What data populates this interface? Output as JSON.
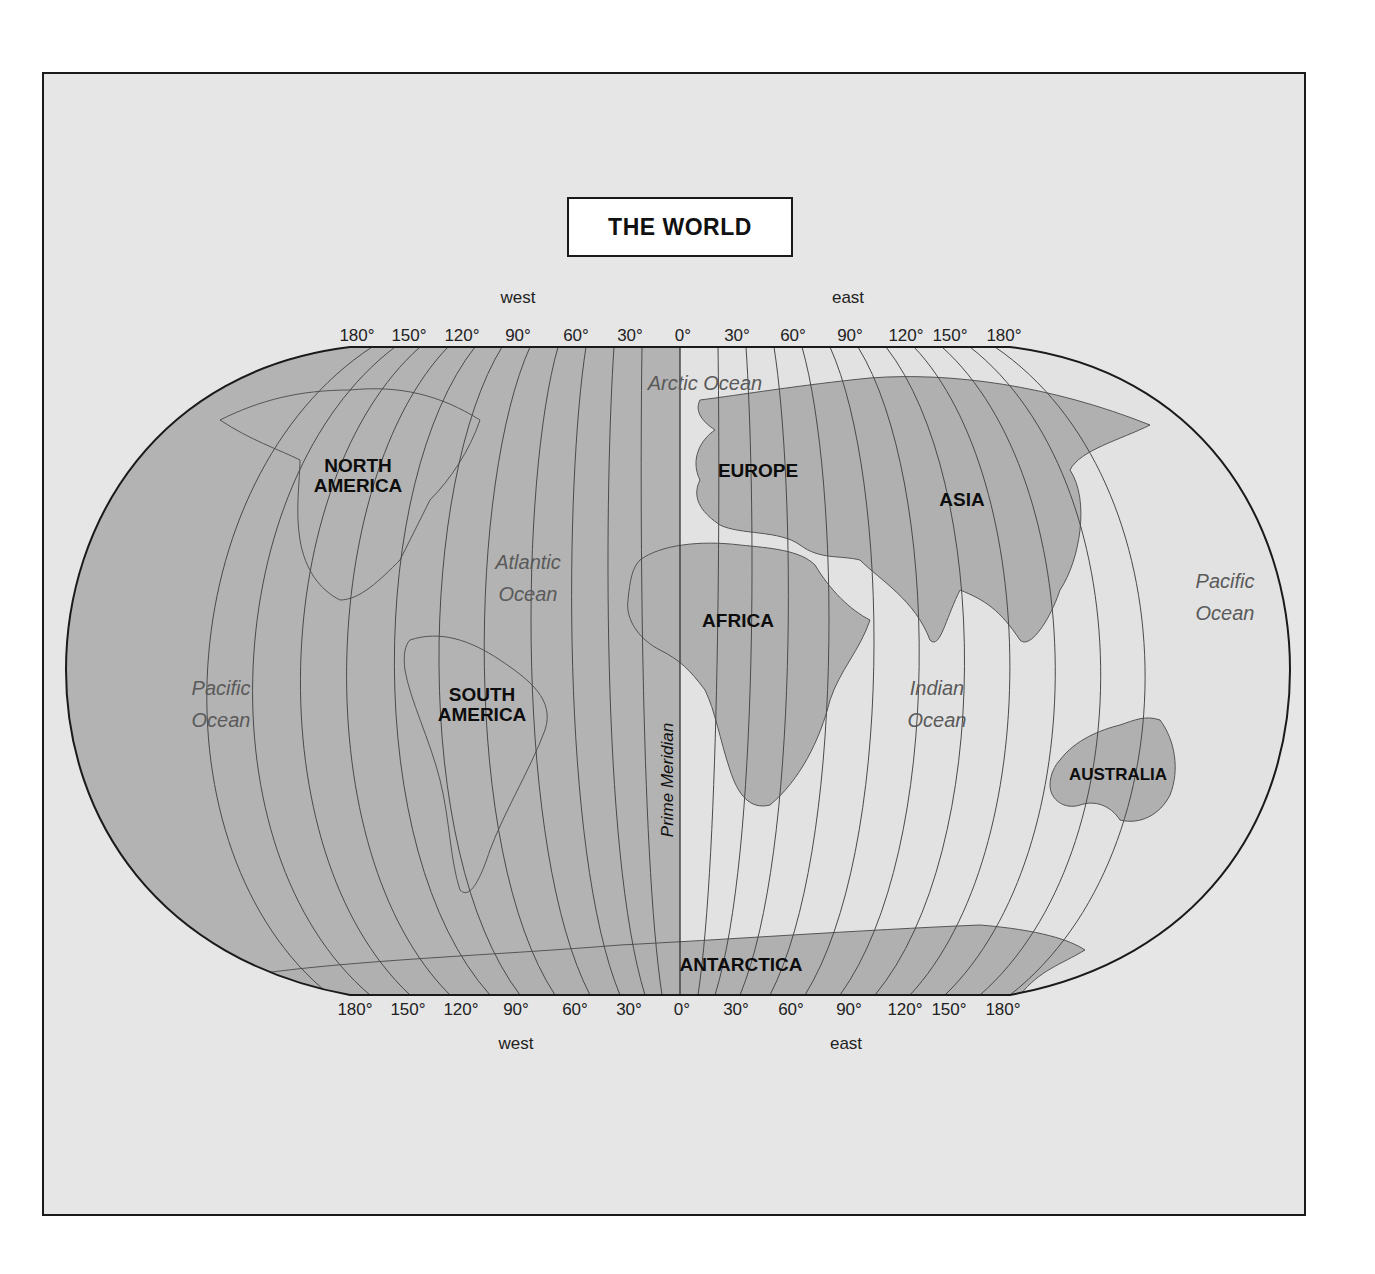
{
  "map": {
    "title": "THE WORLD",
    "top_hemisphere_labels": {
      "west": "west",
      "east": "east"
    },
    "bottom_hemisphere_labels": {
      "west": "west",
      "east": "east"
    },
    "longitude_ticks_top": [
      "180°",
      "150°",
      "120°",
      "90°",
      "60°",
      "30°",
      "0°",
      "30°",
      "60°",
      "90°",
      "120°",
      "150°",
      "180°"
    ],
    "longitude_ticks_bottom": [
      "180°",
      "150°",
      "120°",
      "90°",
      "60°",
      "30°",
      "0°",
      "30°",
      "60°",
      "90°",
      "120°",
      "150°",
      "180°"
    ],
    "prime_meridian_label": "Prime Meridian",
    "continents": {
      "north_america": "NORTH\nAMERICA",
      "south_america": "SOUTH\nAMERICA",
      "europe": "EUROPE",
      "africa": "AFRICA",
      "asia": "ASIA",
      "australia": "AUSTRALIA",
      "antarctica": "ANTARCTICA"
    },
    "oceans": {
      "arctic": "Arctic Ocean",
      "atlantic": "Atlantic\nOcean",
      "pacific_west": "Pacific\nOcean",
      "pacific_east": "Pacific\nOcean",
      "indian": "Indian\nOcean"
    },
    "colors": {
      "frame_background": "#e6e6e6",
      "western_hemisphere_fill": "#b3b3b3",
      "eastern_ocean_fill": "#e2e2e2",
      "land_fill": "#b0b0b0",
      "outline": "#1a1a1a",
      "meridian": "#4a4a4a"
    }
  }
}
